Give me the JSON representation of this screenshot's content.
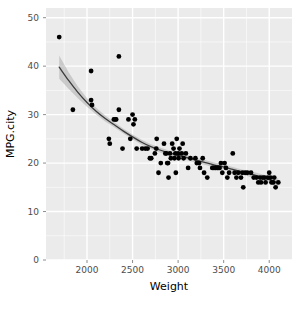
{
  "chart_data": {
    "type": "scatter",
    "title": "",
    "subtitle": "",
    "xlabel": "Weight",
    "ylabel": "MPG.city",
    "xlim": [
      1550,
      4250
    ],
    "ylim": [
      0,
      52
    ],
    "xticks": [
      2000,
      2500,
      3000,
      3500,
      4000
    ],
    "xtick_labels": [
      "2000",
      "2500",
      "3000",
      "3500",
      "4000"
    ],
    "yticks": [
      0,
      10,
      20,
      30,
      40,
      50
    ],
    "ytick_labels": [
      "0",
      "10",
      "20",
      "30",
      "40",
      "50"
    ],
    "grid": true,
    "grid_major": true,
    "grid_minor": true,
    "legend": "none",
    "panel_background": "#ebebeb",
    "grid_color": "#ffffff",
    "point_color": "#000000",
    "point_size": 2.4,
    "smooth_line_color": "#3b3b3b",
    "smooth_band_color": "#a0a0a0",
    "smooth_method": "loess",
    "points": [
      [
        1695,
        46
      ],
      [
        1845,
        31
      ],
      [
        2045,
        39
      ],
      [
        2055,
        32
      ],
      [
        2045,
        33
      ],
      [
        2240,
        25
      ],
      [
        2250,
        24
      ],
      [
        2295,
        29
      ],
      [
        2310,
        29
      ],
      [
        2320,
        29
      ],
      [
        2350,
        31
      ],
      [
        2350,
        42
      ],
      [
        2390,
        23
      ],
      [
        2455,
        29
      ],
      [
        2475,
        25
      ],
      [
        2500,
        30
      ],
      [
        2510,
        28
      ],
      [
        2525,
        29
      ],
      [
        2545,
        23
      ],
      [
        2605,
        23
      ],
      [
        2640,
        23
      ],
      [
        2665,
        23
      ],
      [
        2690,
        21
      ],
      [
        2705,
        21
      ],
      [
        2745,
        22
      ],
      [
        2760,
        23
      ],
      [
        2765,
        25
      ],
      [
        2785,
        18
      ],
      [
        2810,
        20
      ],
      [
        2845,
        24
      ],
      [
        2860,
        22
      ],
      [
        2870,
        22
      ],
      [
        2880,
        20
      ],
      [
        2890,
        20
      ],
      [
        2895,
        17
      ],
      [
        2910,
        22
      ],
      [
        2920,
        21
      ],
      [
        2935,
        24
      ],
      [
        2950,
        23
      ],
      [
        2960,
        21
      ],
      [
        2970,
        22
      ],
      [
        2975,
        18
      ],
      [
        2985,
        25
      ],
      [
        3000,
        22
      ],
      [
        3005,
        21
      ],
      [
        3015,
        23
      ],
      [
        3040,
        22
      ],
      [
        3050,
        24
      ],
      [
        3060,
        21
      ],
      [
        3085,
        22
      ],
      [
        3110,
        19
      ],
      [
        3135,
        21
      ],
      [
        3190,
        21
      ],
      [
        3205,
        20
      ],
      [
        3230,
        20
      ],
      [
        3240,
        19
      ],
      [
        3270,
        21
      ],
      [
        3285,
        18
      ],
      [
        3320,
        17
      ],
      [
        3375,
        19
      ],
      [
        3390,
        19
      ],
      [
        3405,
        19
      ],
      [
        3415,
        19
      ],
      [
        3430,
        19
      ],
      [
        3440,
        19
      ],
      [
        3455,
        19
      ],
      [
        3470,
        20
      ],
      [
        3485,
        18
      ],
      [
        3510,
        20
      ],
      [
        3525,
        19
      ],
      [
        3540,
        17
      ],
      [
        3560,
        18
      ],
      [
        3600,
        22
      ],
      [
        3620,
        18
      ],
      [
        3640,
        17
      ],
      [
        3660,
        18
      ],
      [
        3690,
        17
      ],
      [
        3705,
        18
      ],
      [
        3715,
        15
      ],
      [
        3735,
        18
      ],
      [
        3760,
        18
      ],
      [
        3800,
        18
      ],
      [
        3830,
        17
      ],
      [
        3860,
        17
      ],
      [
        3880,
        16
      ],
      [
        3900,
        17
      ],
      [
        3910,
        16
      ],
      [
        3930,
        17
      ],
      [
        3950,
        17
      ],
      [
        3960,
        16
      ],
      [
        3985,
        17
      ],
      [
        4000,
        18
      ],
      [
        4015,
        17
      ],
      [
        4025,
        16
      ],
      [
        4045,
        16
      ],
      [
        4055,
        17
      ],
      [
        4070,
        15
      ],
      [
        4100,
        16
      ]
    ],
    "smooth_line": [
      [
        1695,
        39.8
      ],
      [
        1800,
        37.0
      ],
      [
        1900,
        34.6
      ],
      [
        2000,
        32.5
      ],
      [
        2100,
        30.7
      ],
      [
        2200,
        29.2
      ],
      [
        2300,
        27.9
      ],
      [
        2400,
        26.6
      ],
      [
        2500,
        25.4
      ],
      [
        2600,
        24.3
      ],
      [
        2700,
        23.4
      ],
      [
        2800,
        22.7
      ],
      [
        2900,
        22.1
      ],
      [
        3000,
        21.6
      ],
      [
        3100,
        21.1
      ],
      [
        3200,
        20.6
      ],
      [
        3300,
        20.1
      ],
      [
        3400,
        19.6
      ],
      [
        3500,
        19.2
      ],
      [
        3600,
        18.7
      ],
      [
        3700,
        18.2
      ],
      [
        3800,
        17.7
      ],
      [
        3900,
        17.2
      ],
      [
        4000,
        16.6
      ],
      [
        4100,
        15.9
      ]
    ],
    "smooth_band_upper": [
      [
        1695,
        42.2
      ],
      [
        1800,
        38.7
      ],
      [
        1900,
        35.8
      ],
      [
        2000,
        33.4
      ],
      [
        2100,
        31.4
      ],
      [
        2200,
        29.8
      ],
      [
        2300,
        28.4
      ],
      [
        2400,
        27.1
      ],
      [
        2500,
        25.9
      ],
      [
        2600,
        24.8
      ],
      [
        2700,
        23.9
      ],
      [
        2800,
        23.2
      ],
      [
        2900,
        22.6
      ],
      [
        3000,
        22.1
      ],
      [
        3100,
        21.6
      ],
      [
        3200,
        21.1
      ],
      [
        3300,
        20.6
      ],
      [
        3400,
        20.1
      ],
      [
        3500,
        19.7
      ],
      [
        3600,
        19.2
      ],
      [
        3700,
        18.7
      ],
      [
        3800,
        18.3
      ],
      [
        3900,
        17.8
      ],
      [
        4000,
        17.3
      ],
      [
        4100,
        16.8
      ]
    ],
    "smooth_band_lower": [
      [
        1695,
        37.4
      ],
      [
        1800,
        35.3
      ],
      [
        1900,
        33.4
      ],
      [
        2000,
        31.6
      ],
      [
        2100,
        30.0
      ],
      [
        2200,
        28.6
      ],
      [
        2300,
        27.4
      ],
      [
        2400,
        26.1
      ],
      [
        2500,
        24.9
      ],
      [
        2600,
        23.8
      ],
      [
        2700,
        22.9
      ],
      [
        2800,
        22.2
      ],
      [
        2900,
        21.6
      ],
      [
        3000,
        21.1
      ],
      [
        3100,
        20.6
      ],
      [
        3200,
        20.1
      ],
      [
        3300,
        19.6
      ],
      [
        3400,
        19.1
      ],
      [
        3500,
        18.7
      ],
      [
        3600,
        18.2
      ],
      [
        3700,
        17.7
      ],
      [
        3800,
        17.1
      ],
      [
        3900,
        16.6
      ],
      [
        4000,
        15.9
      ],
      [
        4100,
        15.0
      ]
    ]
  },
  "layout": {
    "panel": {
      "left": 46,
      "top": 8,
      "right": 292,
      "bottom": 260
    },
    "canvas": {
      "width": 307,
      "height": 315
    }
  }
}
